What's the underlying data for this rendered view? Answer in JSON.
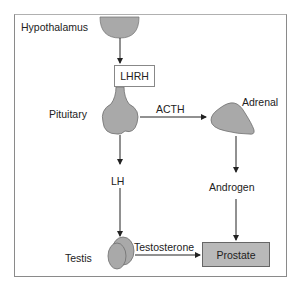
{
  "diagram": {
    "type": "hormonal-pathway",
    "nodes": {
      "hypothalamus": {
        "label": "Hypothalamus"
      },
      "lhrh": {
        "label": "LHRH"
      },
      "pituitary": {
        "label": "Pituitary"
      },
      "adrenal": {
        "label": "Adrenal"
      },
      "lh": {
        "label": "LH"
      },
      "testis": {
        "label": "Testis"
      },
      "androgen": {
        "label": "Androgen"
      },
      "prostate": {
        "label": "Prostate"
      }
    },
    "edges": {
      "acth": {
        "label": "ACTH",
        "from": "Pituitary",
        "to": "Adrenal"
      },
      "testosterone": {
        "label": "Testosterone",
        "from": "Testis",
        "to": "Prostate"
      }
    },
    "colors": {
      "organ_fill": "#a9a9a9",
      "organ_stroke": "#6e6e6e",
      "prostate_fill": "#b9b9b9",
      "arrow": "#222222",
      "frame": "#8a8a8a"
    }
  }
}
